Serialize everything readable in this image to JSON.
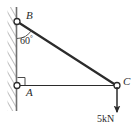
{
  "figure": {
    "type": "statics-free-body-diagram",
    "background_color": "#ffffff",
    "line_color": "#2b2b2b",
    "hatch_color": "#8a8a8a",
    "width_px": 138,
    "height_px": 135
  },
  "wall": {
    "name": "fixed-wall",
    "face_x": 16.5,
    "top_y": 7,
    "bottom_y": 111,
    "hatch_width": 9,
    "hatch_angle_deg": 60
  },
  "joints": [
    {
      "id": "B",
      "label": "B",
      "x": 17,
      "y": 21,
      "type": "pin-support",
      "on_wall": true
    },
    {
      "id": "A",
      "label": "A",
      "x": 17,
      "y": 85.5,
      "type": "pin-support",
      "on_wall": true
    },
    {
      "id": "C",
      "label": "C",
      "x": 117,
      "y": 85.5,
      "type": "pin-joint",
      "on_wall": false
    }
  ],
  "members": [
    {
      "id": "BC",
      "from": "B",
      "to": "C",
      "style": "thick",
      "stroke_width": 2.2,
      "description": "diagonal top chord from B down to C"
    },
    {
      "id": "AC",
      "from": "A",
      "to": "C",
      "style": "thin",
      "stroke_width": 1.2,
      "description": "horizontal bottom chord from A to C"
    }
  ],
  "annotations": {
    "angle": {
      "label": "60",
      "degree_symbol": "°",
      "value": 60,
      "unit": "deg",
      "at_joint": "B",
      "between": [
        "wall-vertical-AB",
        "member-BC"
      ],
      "arc_radius": 17
    },
    "right_angle_marker": {
      "at_joint": "A",
      "between": [
        "wall-vertical-AB",
        "member-AC"
      ],
      "size": 7,
      "value": 90,
      "unit": "deg"
    }
  },
  "load": {
    "label": "5kN",
    "magnitude": 5,
    "unit": "kN",
    "direction": "down",
    "applied_at": "C",
    "arrow_from_y": 86,
    "arrow_to_y": 112
  }
}
